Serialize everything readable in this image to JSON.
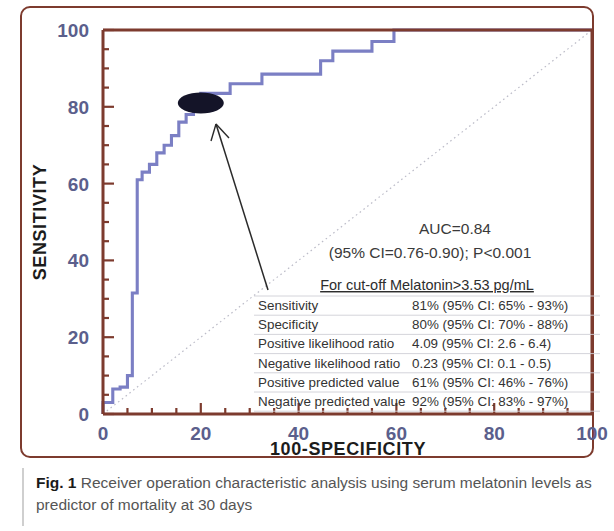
{
  "figure": {
    "caption_label": "Fig. 1",
    "caption_text": " Receiver operation characteristic analysis using serum melatonin levels as predictor of mortality at 30 days"
  },
  "chart_data": {
    "type": "line",
    "title": "",
    "xlabel": "100-SPECIFICITY",
    "ylabel": "SENSITIVITY",
    "xlim": [
      0,
      100
    ],
    "ylim": [
      0,
      100
    ],
    "xticks": [
      "0",
      "20",
      "40",
      "60",
      "80",
      "100"
    ],
    "xtick_values": [
      0,
      20,
      40,
      60,
      80,
      100
    ],
    "yticks": [
      "0",
      "20",
      "40",
      "60",
      "80",
      "100"
    ],
    "ytick_values": [
      0,
      20,
      40,
      60,
      80,
      100
    ],
    "minor_tick_step": 5,
    "grid": false,
    "legend": "none",
    "curve_color": "#7b7fc4",
    "frame_color": "#7d3b2e",
    "reference_line": {
      "label": "chance diagonal",
      "x": [
        0,
        100
      ],
      "y": [
        0,
        100
      ],
      "style": "dotted",
      "color": "#b9b9c4"
    },
    "series": [
      {
        "name": "ROC curve (serum melatonin)",
        "step": "post",
        "x": [
          0,
          0,
          2,
          2,
          3.5,
          3.5,
          5,
          5,
          6,
          6,
          7,
          7,
          8,
          8,
          9.5,
          9.5,
          11,
          11,
          12.5,
          12.5,
          14,
          14,
          15.5,
          15.5,
          17,
          17,
          18.5,
          18.5,
          20,
          20,
          26,
          26,
          32.5,
          32.5,
          44.5,
          44.5,
          47,
          47,
          55,
          55,
          59.5,
          59.5,
          73,
          73,
          100
        ],
        "y": [
          0,
          3,
          3,
          6.5,
          6.5,
          7,
          7,
          10,
          10,
          31.5,
          31.5,
          61,
          61,
          63,
          63,
          65,
          65,
          68,
          68,
          70,
          70,
          72.5,
          72.5,
          76,
          76,
          78,
          78,
          81,
          81,
          83.5,
          83.5,
          86,
          86,
          88.5,
          88.5,
          92,
          92,
          94.5,
          94.5,
          97,
          97,
          100,
          100,
          100,
          100
        ]
      }
    ],
    "marker": {
      "label": "selected cut-off point",
      "x": 20,
      "y": 81,
      "shape": "filled-ellipse",
      "color": "#141428"
    },
    "annotations": {
      "auc_line": "AUC=0.84",
      "ci_line_pre": "(95% CI=0.76-0.90); ",
      "ci_line_p_italic": "P",
      "ci_line_post": "<0.001",
      "table_title": "For cut-off Melatonin>3.53 pg/mL",
      "table_rows": [
        {
          "label": "Sensitivity",
          "value": "81% (95% CI: 65% - 93%)"
        },
        {
          "label": "Specificity",
          "value": "80% (95% CI: 70% - 88%)"
        },
        {
          "label": "Positive likelihood ratio",
          "value": "4.09 (95% CI: 2.6 - 6.4)"
        },
        {
          "label": "Negative likelihood ratio",
          "value": "0.23 (95% CI: 0.1 - 0.5)"
        },
        {
          "label": "Positive predicted value",
          "value": "61% (95% CI: 46% - 76%)"
        },
        {
          "label": "Negative predicted value",
          "value": "92% (95% CI: 83% - 97%)"
        }
      ],
      "arrow": {
        "label": "pointer to cut-off marker"
      }
    }
  }
}
